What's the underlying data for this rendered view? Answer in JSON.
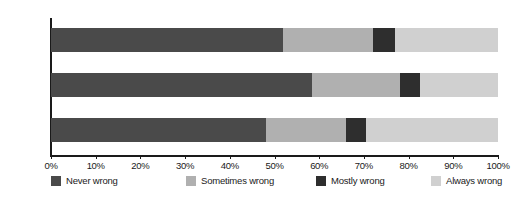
{
  "chart_data": {
    "type": "bar",
    "orientation": "horizontal",
    "stacked": true,
    "normalized": true,
    "title": "",
    "subtitle": "",
    "xlabel": "",
    "ylabel": "",
    "categories": [
      "All",
      "Women",
      "Men"
    ],
    "series": [
      {
        "name": "Never wrong",
        "color": "#4a4a4a",
        "values": [
          52.0,
          58.5,
          48.0
        ]
      },
      {
        "name": "Sometimes wrong",
        "color": "#b0b0b0",
        "values": [
          20.0,
          19.5,
          18.0
        ]
      },
      {
        "name": "Mostly wrong",
        "color": "#2e2e2e",
        "values": [
          5.0,
          4.5,
          4.5
        ]
      },
      {
        "name": "Always wrong",
        "color": "#d0d0d0",
        "values": [
          23.0,
          17.5,
          29.5
        ]
      }
    ],
    "xlim": [
      0,
      100
    ],
    "xticks": [
      0,
      10,
      20,
      30,
      40,
      50,
      60,
      70,
      80,
      90,
      100
    ],
    "xtick_labels": [
      "0%",
      "10%",
      "20%",
      "30%",
      "40%",
      "50%",
      "60%",
      "70%",
      "80%",
      "90%",
      "100%"
    ],
    "grid": false,
    "legend_position": "bottom",
    "legend_entries": [
      "Never wrong",
      "Sometimes wrong",
      "Mostly wrong",
      "Always wrong"
    ],
    "annotations": []
  },
  "axis": {
    "line_color": "#1a1a1a"
  }
}
